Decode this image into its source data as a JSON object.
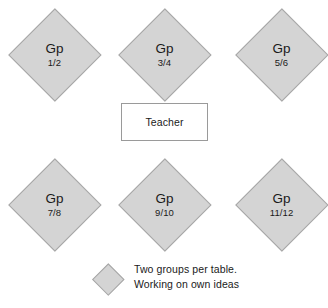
{
  "diagram": {
    "background_color": "#ffffff",
    "node_fill_color": "#d4d4d4",
    "node_border_color": "#a6a6a6",
    "text_color": "#1a1a1a"
  },
  "groups": [
    {
      "name": "Gp",
      "number": "1/2",
      "shape": "diamond",
      "x": 8,
      "y": 8
    },
    {
      "name": "Gp",
      "number": "3/4",
      "shape": "diamond",
      "x": 118,
      "y": 8
    },
    {
      "name": "Gp",
      "number": "5/6",
      "shape": "diamond",
      "x": 235,
      "y": 8
    },
    {
      "name": "Gp",
      "number": "7/8",
      "shape": "diamond",
      "x": 8,
      "y": 158
    },
    {
      "name": "Gp",
      "number": "9/10",
      "shape": "diamond",
      "x": 118,
      "y": 158
    },
    {
      "name": "Gp",
      "number": "11/12",
      "shape": "diamond",
      "x": 235,
      "y": 158
    }
  ],
  "teacher": {
    "label": "Teacher",
    "shape": "rectangle",
    "fill_color": "#ffffff",
    "border_color": "#9a9a9a"
  },
  "legend": {
    "swatch_shape": "diamond",
    "swatch_fill_color": "#d4d4d4",
    "line1": "Two groups per table.",
    "line2": "Working on own ideas"
  }
}
